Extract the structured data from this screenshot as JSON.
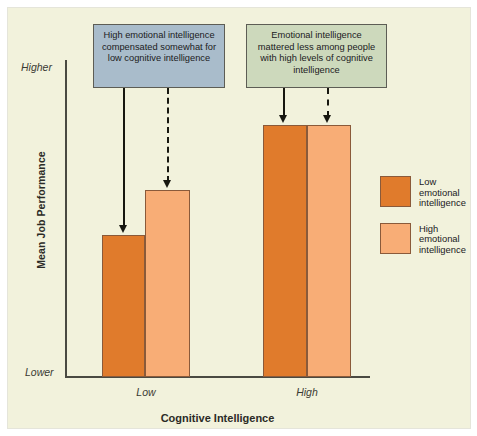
{
  "chart_data": {
    "type": "bar",
    "title": "",
    "xlabel": "Cognitive Intelligence",
    "ylabel": "Mean Job Performance",
    "categories": [
      "Low",
      "High"
    ],
    "ytick_labels": [
      "Higher",
      "Lower"
    ],
    "ylim_labels": {
      "low": "Lower",
      "high": "Higher"
    },
    "grid": false,
    "legend_position": "right",
    "series": [
      {
        "name": "Low emotional intelligence",
        "color": "#e07b2c",
        "values": [
          0.56,
          1.0
        ],
        "value_unit": "relative mean job performance (0 = Lower, 1 = Higher)"
      },
      {
        "name": "High emotional intelligence",
        "color": "#f8ad76",
        "values": [
          0.74,
          1.0
        ],
        "value_unit": "relative mean job performance (0 = Lower, 1 = Higher)"
      }
    ],
    "annotations": [
      {
        "id": "callout-left",
        "text": "High emotional intelligence compensated somewhat for low cognitive intelligence",
        "color": "#a9bccb",
        "points_to": [
          "Low / Low emotional intelligence",
          "Low / High emotional intelligence"
        ]
      },
      {
        "id": "callout-right",
        "text": "Emotional intelligence mattered less among people with high levels of cognitive intelligence",
        "color": "#cdd9bc",
        "points_to": [
          "High / Low emotional intelligence",
          "High / High emotional intelligence"
        ]
      }
    ]
  },
  "axes": {
    "y_title": "Mean Job Performance",
    "y_high_label": "Higher",
    "y_low_label": "Lower",
    "x_title": "Cognitive Intelligence",
    "x_tick_low": "Low",
    "x_tick_high": "High"
  },
  "callouts": {
    "left": {
      "text": "High emotional intelligence compensated somewhat for low cognitive intelligence",
      "bg": "#a9bccb"
    },
    "right": {
      "text": "Emotional intelligence mattered less among people with high levels of cognitive intelligence",
      "bg": "#cdd9bc"
    }
  },
  "legend": {
    "items": [
      {
        "label": "Low\nemotional\nintelligence",
        "color": "#e07b2c",
        "swatch": "low-ei-swatch"
      },
      {
        "label": "High\nemotional\nintelligence",
        "color": "#f8ad76",
        "swatch": "high-ei-swatch"
      }
    ]
  },
  "colors": {
    "panel_background": "#f2f2dc",
    "low_emotional_intelligence": "#e07b2c",
    "high_emotional_intelligence": "#f8ad76",
    "bar_border": "#8a5a3a",
    "axis": "#4a4a42",
    "arrow": "#17170f"
  }
}
